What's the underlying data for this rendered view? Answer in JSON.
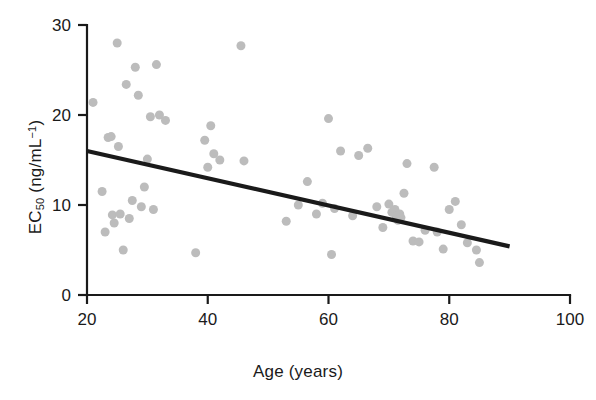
{
  "chart_data": {
    "type": "scatter",
    "title": "",
    "xlabel": "Age (years)",
    "ylabel": "EC50 (ng/mL-1)",
    "ylabel_parts": {
      "base": "EC",
      "sub": "50",
      "unit_prefix": " (ng/mL",
      "sup": "−1",
      "unit_suffix": ")"
    },
    "xlim": [
      20,
      100
    ],
    "ylim": [
      0,
      30
    ],
    "xticks": [
      20,
      40,
      60,
      80,
      100
    ],
    "yticks": [
      0,
      10,
      20,
      30
    ],
    "xtick_labels": [
      "20",
      "40",
      "60",
      "80",
      "100"
    ],
    "ytick_labels": [
      "0",
      "10",
      "20",
      "30"
    ],
    "grid": false,
    "legend": null,
    "point_color": "#bcbcbc",
    "point_size": 9,
    "line_color": "#1a1a1a",
    "axis_color": "#1a1a1a",
    "trend": {
      "type": "linear-fit",
      "x_start": 20,
      "y_start": 16.0,
      "x_end": 90,
      "y_end": 5.4,
      "slope": -0.151,
      "intercept": 19.03
    },
    "x": [
      21.0,
      22.5,
      23.0,
      23.5,
      24.0,
      24.2,
      24.5,
      25.0,
      25.2,
      25.5,
      26.0,
      26.5,
      27.0,
      27.5,
      28.0,
      28.5,
      29.0,
      29.5,
      30.0,
      30.5,
      31.0,
      31.5,
      32.0,
      33.0,
      38.0,
      39.5,
      40.0,
      40.5,
      41.0,
      42.0,
      45.5,
      46.0,
      53.0,
      55.0,
      56.5,
      58.0,
      59.0,
      60.0,
      60.5,
      61.0,
      62.0,
      64.0,
      65.0,
      66.5,
      68.0,
      69.0,
      70.0,
      70.5,
      71.0,
      71.2,
      71.5,
      71.8,
      72.0,
      72.5,
      73.0,
      74.0,
      75.0,
      76.0,
      77.5,
      78.0,
      79.0,
      80.0,
      81.0,
      82.0,
      83.0,
      84.5,
      85.0
    ],
    "y": [
      21.4,
      11.5,
      7.0,
      17.5,
      17.6,
      8.9,
      8.0,
      28.0,
      16.5,
      9.0,
      5.0,
      23.4,
      8.5,
      10.5,
      25.3,
      22.2,
      9.8,
      12.0,
      15.1,
      19.8,
      9.5,
      25.6,
      20.0,
      19.4,
      4.7,
      17.2,
      14.2,
      18.8,
      15.7,
      15.0,
      27.7,
      14.9,
      8.2,
      10.0,
      12.6,
      9.0,
      10.2,
      19.6,
      4.5,
      9.6,
      16.0,
      8.8,
      15.5,
      16.3,
      9.8,
      7.5,
      10.1,
      9.2,
      9.5,
      8.8,
      8.3,
      9.0,
      8.6,
      11.3,
      14.6,
      6.0,
      5.9,
      7.2,
      14.2,
      7.0,
      5.1,
      9.5,
      10.4,
      7.8,
      5.8,
      5.0,
      3.6
    ],
    "n_points": 67
  }
}
